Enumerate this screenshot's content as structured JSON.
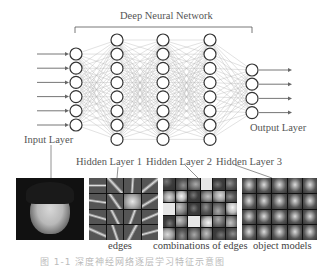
{
  "title": "Deep Neural Network",
  "layers": {
    "input": {
      "label": "Input Layer",
      "nodes": 6
    },
    "hidden1": {
      "label": "Hidden Layer 1",
      "nodes": 8
    },
    "hidden2": {
      "label": "Hidden Layer 2",
      "nodes": 8
    },
    "hidden3": {
      "label": "Hidden Layer 3",
      "nodes": 8
    },
    "output": {
      "label": "Output Layer",
      "nodes": 4
    }
  },
  "panels": {
    "face": {
      "caption": ""
    },
    "edges": {
      "caption": "edges"
    },
    "combinations": {
      "caption": "combinations of edges"
    },
    "objects": {
      "caption": "object models"
    }
  },
  "figure_caption": "图 1-1  深度神经网络逐层学习特征示意图",
  "colors": {
    "line": "#9a9a9a",
    "node": "#333333",
    "text": "#555555"
  }
}
